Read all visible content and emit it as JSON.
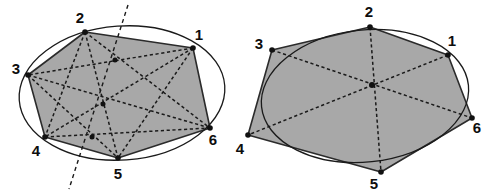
{
  "figure": {
    "caption": "",
    "colors": {
      "hexagon_fill": "#a8a8a8",
      "hexagon_stroke": "#2b2b2b",
      "conic_stroke": "#1a1a1a",
      "dashed_stroke": "#1a1a1a",
      "label_color": "#0d0d0d",
      "background": "#ffffff"
    },
    "panels": [
      {
        "name": "left-panel",
        "description": "Hexagon inscribed in an ellipse with Pascal line",
        "conic": {
          "type": "ellipse",
          "cx": 122,
          "cy": 93,
          "rx": 103,
          "ry": 67,
          "rotation": -4
        },
        "vertices": [
          {
            "id": "1",
            "x": 193,
            "y": 48,
            "label_x": 199,
            "label_y": 36
          },
          {
            "id": "2",
            "x": 85,
            "y": 32,
            "label_x": 80,
            "label_y": 19
          },
          {
            "id": "3",
            "x": 28,
            "y": 75,
            "label_x": 16,
            "label_y": 70
          },
          {
            "id": "4",
            "x": 45,
            "y": 137,
            "label_x": 36,
            "label_y": 152
          },
          {
            "id": "5",
            "x": 118,
            "y": 158,
            "label_x": 118,
            "label_y": 175
          },
          {
            "id": "6",
            "x": 210,
            "y": 128,
            "label_x": 213,
            "label_y": 141
          }
        ],
        "hexagon_order": [
          "3",
          "2",
          "1",
          "6",
          "5",
          "4"
        ],
        "dashed_chords": [
          [
            "1",
            "3"
          ],
          [
            "1",
            "4"
          ],
          [
            "1",
            "5"
          ],
          [
            "2",
            "4"
          ],
          [
            "2",
            "5"
          ],
          [
            "2",
            "6"
          ],
          [
            "3",
            "5"
          ],
          [
            "3",
            "6"
          ],
          [
            "4",
            "6"
          ]
        ],
        "intersection_points": [
          {
            "x": 115,
            "y": 60
          },
          {
            "x": 103,
            "y": 104
          },
          {
            "x": 92,
            "y": 137
          }
        ],
        "pascal_line": {
          "x1": 128,
          "y1": 5,
          "x2": 69,
          "y2": 189
        }
      },
      {
        "name": "right-panel",
        "description": "Hexagon circumscribed about an ellipse with concurrent diagonals (Brianchon point)",
        "conic": {
          "type": "ellipse",
          "cx": 365,
          "cy": 96,
          "rx": 104,
          "ry": 66,
          "rotation": -6
        },
        "vertices": [
          {
            "id": "1",
            "x": 448,
            "y": 55,
            "label_x": 452,
            "label_y": 42
          },
          {
            "id": "2",
            "x": 370,
            "y": 27,
            "label_x": 369,
            "label_y": 13
          },
          {
            "id": "3",
            "x": 272,
            "y": 50,
            "label_x": 259,
            "label_y": 45
          },
          {
            "id": "4",
            "x": 248,
            "y": 135,
            "label_x": 240,
            "label_y": 150
          },
          {
            "id": "5",
            "x": 381,
            "y": 172,
            "label_x": 374,
            "label_y": 185
          },
          {
            "id": "6",
            "x": 472,
            "y": 118,
            "label_x": 477,
            "label_y": 129
          }
        ],
        "hexagon_order": [
          "3",
          "2",
          "1",
          "6",
          "5",
          "4"
        ],
        "dashed_diagonals": [
          [
            "1",
            "4"
          ],
          [
            "2",
            "5"
          ],
          [
            "3",
            "6"
          ]
        ],
        "brianchon_point": {
          "x": 372,
          "y": 85
        }
      }
    ]
  }
}
